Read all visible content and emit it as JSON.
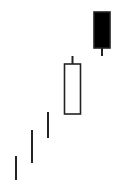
{
  "chart_data": {
    "type": "candlestick",
    "title": "",
    "xlabel": "",
    "ylabel": "",
    "grid": false,
    "legend": null,
    "pixel_space": {
      "width": 120,
      "height": 196
    },
    "colors": {
      "line": "#222222",
      "bearish_fill": "#000000",
      "bullish_fill": "#ffffff",
      "background": "#ffffff"
    },
    "candles": [
      {
        "index": 0,
        "x": 16,
        "kind": "doji-line",
        "high": 156,
        "low": 180
      },
      {
        "index": 1,
        "x": 32,
        "kind": "doji-line",
        "high": 130,
        "low": 163
      },
      {
        "index": 2,
        "x": 48,
        "kind": "doji-line",
        "high": 112,
        "low": 138
      },
      {
        "index": 3,
        "x": 72.5,
        "kind": "bullish",
        "body_width": 16,
        "high": 56,
        "body_top": 64,
        "body_bottom": 114,
        "low": 114
      },
      {
        "index": 4,
        "x": 102,
        "kind": "bearish",
        "body_width": 16,
        "high": 12,
        "body_top": 12,
        "body_bottom": 48,
        "low": 56
      }
    ]
  }
}
